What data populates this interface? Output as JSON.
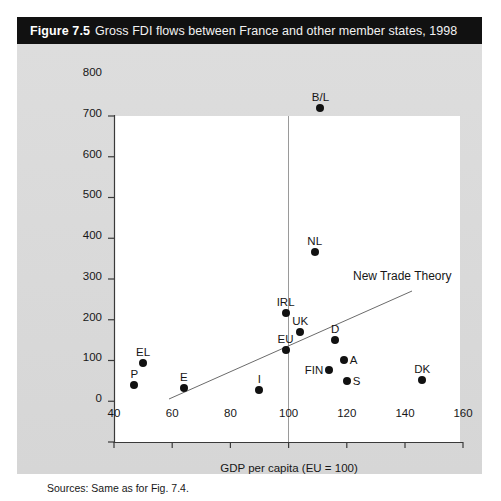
{
  "figure": {
    "number_label": "Figure 7.5",
    "caption": "Gross FDI flows between France and other member states, 1998",
    "source_note": "Sources: Same as for Fig. 7.4.",
    "title_bar_color": "#111111",
    "panel_color": "#dcdcdc",
    "plot_background": "#ffffff",
    "marker_color": "#111111"
  },
  "chart_data": {
    "type": "scatter",
    "title": "Gross FDI flows between France and other member states, 1998",
    "xlabel": "GDP per capita (EU = 100)",
    "ylabel": "FDI gross flows per capita",
    "xlim": [
      40,
      160
    ],
    "ylim": [
      0,
      800
    ],
    "xticks": [
      40,
      60,
      80,
      100,
      120,
      140,
      160
    ],
    "yticks": [
      0,
      100,
      200,
      300,
      400,
      500,
      600,
      700,
      800
    ],
    "grid": "single vertical reference line at x = 100",
    "legend": "none",
    "reference_line_x": 100,
    "points": [
      {
        "label": "B/L",
        "x": 111,
        "y": 712,
        "label_pos": "above"
      },
      {
        "label": "NL",
        "x": 109,
        "y": 358,
        "label_pos": "above"
      },
      {
        "label": "IRL",
        "x": 99,
        "y": 208,
        "label_pos": "above"
      },
      {
        "label": "UK",
        "x": 104,
        "y": 163,
        "label_pos": "above"
      },
      {
        "label": "EU",
        "x": 99,
        "y": 118,
        "label_pos": "above"
      },
      {
        "label": "D",
        "x": 116,
        "y": 142,
        "label_pos": "above"
      },
      {
        "label": "A",
        "x": 119,
        "y": 93,
        "label_pos": "right"
      },
      {
        "label": "FIN",
        "x": 114,
        "y": 69,
        "label_pos": "left"
      },
      {
        "label": "S",
        "x": 120,
        "y": 42,
        "label_pos": "right"
      },
      {
        "label": "DK",
        "x": 146,
        "y": 44,
        "label_pos": "above"
      },
      {
        "label": "I",
        "x": 90,
        "y": 20,
        "label_pos": "above"
      },
      {
        "label": "E",
        "x": 64,
        "y": 25,
        "label_pos": "above"
      },
      {
        "label": "EL",
        "x": 50,
        "y": 85,
        "label_pos": "above"
      },
      {
        "label": "P",
        "x": 47,
        "y": 32,
        "label_pos": "above"
      }
    ],
    "annotations": [
      {
        "text": "New Trade Theory",
        "type": "trend-line",
        "line_from": {
          "x": 59,
          "y": 105
        },
        "line_to": {
          "x": 142,
          "y": 370
        }
      }
    ]
  },
  "axes": {
    "x_tick_labels": [
      "40",
      "60",
      "80",
      "100",
      "120",
      "140",
      "160"
    ],
    "y_tick_labels": [
      "0",
      "100",
      "200",
      "300",
      "400",
      "500",
      "600",
      "700",
      "800"
    ],
    "x_title": "GDP per capita (EU = 100)",
    "y_title": "FDI gross flows per capita"
  },
  "annotation": {
    "trend_label": "New Trade Theory"
  }
}
